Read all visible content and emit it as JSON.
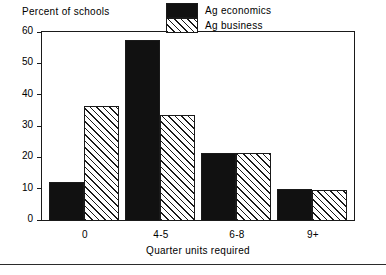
{
  "chart_data": {
    "type": "bar",
    "title": "",
    "ylabel": "Percent of schools",
    "xlabel": "Quarter units required",
    "categories": [
      "0",
      "4-5",
      "6-8",
      "9+"
    ],
    "series": [
      {
        "name": "Ag economics",
        "values": [
          12,
          57.5,
          21.5,
          10
        ]
      },
      {
        "name": "Ag business",
        "values": [
          36.5,
          33.5,
          21.5,
          9.7
        ]
      }
    ],
    "ylim": [
      0,
      60
    ],
    "yticks": [
      0,
      10,
      20,
      30,
      40,
      50,
      60
    ],
    "ytick_labels": [
      "0",
      "10",
      "20",
      "30",
      "40",
      "50",
      "60"
    ],
    "grid": false,
    "legend_position": "upper right",
    "colors": {
      "ag_economics": "#111111",
      "ag_business": "#ffffff",
      "outline": "#1a1a1a"
    }
  },
  "legend": {
    "entries": [
      {
        "label": "Ag economics",
        "swatch": "solid-black"
      },
      {
        "label": "Ag business",
        "swatch": "diagonal-hatch"
      }
    ]
  }
}
